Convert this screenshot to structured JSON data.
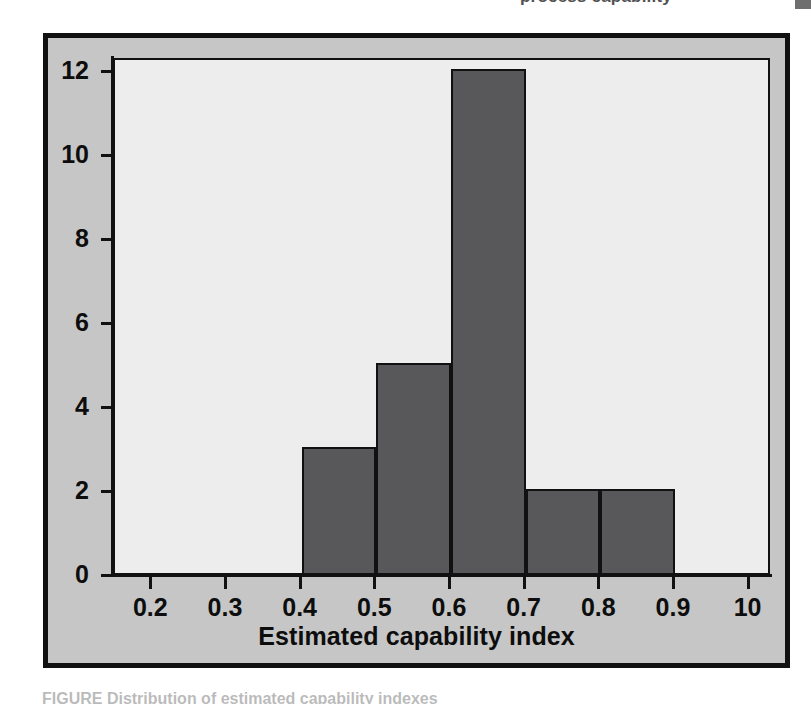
{
  "page": {
    "clipped_header_fragment": "process capability",
    "clipped_caption_fragment": "FIGURE    Distribution of estimated capability indexes",
    "ghost_bleed": {
      "line1": "indexes above 1.33",
      "line2": "capability studies",
      "line3": "Section 8.7",
      "line4": "of the process is",
      "line5": "estimated by the",
      "line6": "confidence interval",
      "line7": "on the capability",
      "line8": "index is obtained",
      "line9": "from the sample"
    }
  },
  "figure": {
    "frame_color": "#c6c6c6",
    "border_color": "#111111",
    "plot_background": "#ededed"
  },
  "chart_data": {
    "type": "bar",
    "title": "",
    "subtitle": "",
    "xlabel": "Estimated capability index",
    "ylabel": "",
    "bin_edges": [
      0.2,
      0.3,
      0.4,
      0.5,
      0.6,
      0.7,
      0.8,
      0.9,
      1.0
    ],
    "categories": [
      "0.2-0.3",
      "0.3-0.4",
      "0.4-0.5",
      "0.5-0.6",
      "0.6-0.7",
      "0.7-0.8",
      "0.8-0.9",
      "0.9-1.0"
    ],
    "values": [
      0,
      0,
      3,
      5,
      12,
      2,
      2,
      0
    ],
    "bars": [
      {
        "label": "0.4-0.5",
        "x0": 0.4,
        "x1": 0.5,
        "value": 3
      },
      {
        "label": "0.5-0.6",
        "x0": 0.5,
        "x1": 0.6,
        "value": 5
      },
      {
        "label": "0.6-0.7",
        "x0": 0.6,
        "x1": 0.7,
        "value": 12
      },
      {
        "label": "0.7-0.8",
        "x0": 0.7,
        "x1": 0.8,
        "value": 2
      },
      {
        "label": "0.8-0.9",
        "x0": 0.8,
        "x1": 0.9,
        "value": 2
      }
    ],
    "bar_color": "#58585a",
    "bar_edge_color": "#111111",
    "xlim": [
      0.15,
      1.03
    ],
    "ylim": [
      0,
      12.3
    ],
    "xticks": [
      0.2,
      0.3,
      0.4,
      0.5,
      0.6,
      0.7,
      0.8,
      0.9,
      1.0
    ],
    "xtick_labels": [
      "0.2",
      "0.3",
      "0.4",
      "0.5",
      "0.6",
      "0.7",
      "0.8",
      "0.9",
      "10"
    ],
    "yticks": [
      0,
      2,
      4,
      6,
      8,
      10,
      12
    ],
    "ytick_labels": [
      "0",
      "2",
      "4",
      "6",
      "8",
      "10",
      "12"
    ],
    "grid": false,
    "legend": null,
    "legend_position": "none",
    "annotations": []
  }
}
